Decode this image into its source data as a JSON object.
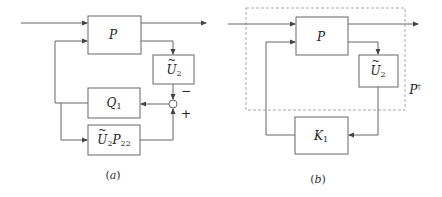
{
  "diagram_a": {
    "caption_open": "(",
    "caption_letter": "a",
    "caption_close": ")",
    "blocks": {
      "plant": {
        "symbol": "P"
      },
      "u2": {
        "symbol": "U",
        "sub": "2"
      },
      "q1": {
        "symbol": "Q",
        "sub": "1"
      },
      "u2p22": {
        "symbol1": "U",
        "sub1": "2",
        "symbol2": "P",
        "sub2": "22"
      }
    },
    "summing_junction": {
      "minus_label": "−",
      "plus_label": "+"
    }
  },
  "diagram_b": {
    "caption_open": "(",
    "caption_letter": "b",
    "caption_close": ")",
    "blocks": {
      "plant": {
        "symbol": "P"
      },
      "u2": {
        "symbol": "U",
        "sub": "2"
      },
      "k1": {
        "symbol": "K",
        "sub": "1"
      }
    },
    "augmented_plant_label": {
      "symbol": "P",
      "sup": "†"
    }
  },
  "colors": {
    "stroke": "#666666",
    "dashed": "#aaaaaa",
    "text": "#222222"
  }
}
